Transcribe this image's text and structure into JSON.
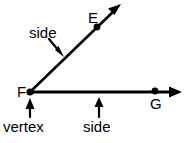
{
  "figure": {
    "kind": "geometry-angle-diagram",
    "background_color": "#ffffff",
    "stroke_color": "#000000",
    "width": 185,
    "height": 143
  },
  "points": [
    {
      "id": "E",
      "label": "E",
      "x": 97,
      "y": 27,
      "label_x": 88,
      "label_y": 10
    },
    {
      "id": "F",
      "label": "F",
      "x": 30,
      "y": 92,
      "label_x": 17,
      "label_y": 84
    },
    {
      "id": "G",
      "label": "G",
      "x": 155,
      "y": 92,
      "label_x": 150,
      "label_y": 96
    }
  ],
  "rays": [
    {
      "id": "ray-FE",
      "name": "diagonal-ray",
      "from": "F",
      "through": "E",
      "start_x": 30,
      "start_y": 92,
      "end_x": 120,
      "end_y": 5,
      "has_arrowhead": true
    },
    {
      "id": "ray-FG",
      "name": "horizontal-ray",
      "from": "F",
      "through": "G",
      "start_x": 30,
      "start_y": 92,
      "end_x": 181,
      "end_y": 92,
      "has_arrowhead": true
    }
  ],
  "annotations": [
    {
      "id": "side-diagonal",
      "text": "side",
      "pointer_from_x": 50,
      "pointer_from_y": 40,
      "pointer_to_x": 62,
      "pointer_to_y": 55,
      "direction": "down-right"
    },
    {
      "id": "side-horizontal",
      "text": "side",
      "pointer_from_x": 99,
      "pointer_from_y": 117,
      "pointer_to_x": 99,
      "pointer_to_y": 98,
      "direction": "up"
    },
    {
      "id": "vertex",
      "text": "vertex",
      "pointer_from_x": 30,
      "pointer_from_y": 117,
      "pointer_to_x": 30,
      "pointer_to_y": 99,
      "direction": "up"
    }
  ]
}
